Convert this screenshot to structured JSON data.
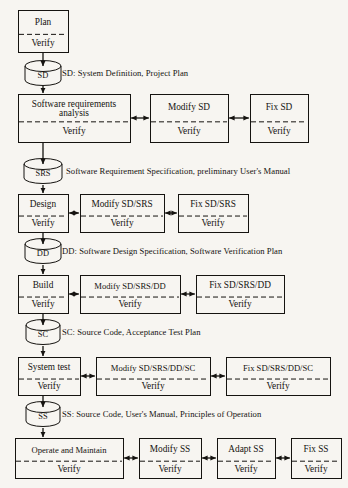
{
  "diagram": {
    "type": "flowchart",
    "background_color": "#f7f5f1",
    "ink_color": "#151310",
    "verify_label": "Verify"
  },
  "stages": [
    {
      "id": "plan",
      "main": {
        "name": "plan-box",
        "top_label": "Plan",
        "bottom_label": "Verify",
        "x": 18,
        "y": 10,
        "w": 50,
        "h": 42
      },
      "siblings": [],
      "artifact": {
        "name": "sd-cylinder",
        "label": "SD",
        "legend": "SD: System Definition, Project Plan",
        "cx": 43,
        "cy": 73,
        "rx": 18,
        "ry": 5.5,
        "body_h": 14,
        "legend_x": 62,
        "legend_y": 73
      }
    },
    {
      "id": "requirements",
      "main": {
        "name": "software-requirements-analysis-box",
        "top_label_line1": "Software requirements",
        "top_label_line2": "analysis",
        "bottom_label": "Verify",
        "x": 18,
        "y": 94,
        "w": 112,
        "h": 48
      },
      "siblings": [
        {
          "name": "modify-sd-box",
          "top_label": "Modify SD",
          "bottom_label": "Verify",
          "x": 150,
          "y": 94,
          "w": 78,
          "h": 48
        },
        {
          "name": "fix-sd-box",
          "top_label": "Fix SD",
          "bottom_label": "Verify",
          "x": 250,
          "y": 94,
          "w": 58,
          "h": 48
        }
      ],
      "artifact": {
        "name": "srs-cylinder",
        "label": "SRS",
        "legend": "Software Requirement Specification, preliminary User's Manual",
        "cx": 43,
        "cy": 171,
        "rx": 19,
        "ry": 5.5,
        "body_h": 14,
        "legend_x": 66,
        "legend_y": 171
      }
    },
    {
      "id": "design",
      "main": {
        "name": "design-box",
        "top_label": "Design",
        "bottom_label": "Verify",
        "x": 18,
        "y": 194,
        "w": 50,
        "h": 38
      },
      "siblings": [
        {
          "name": "modify-sd-srs-box",
          "top_label": "Modify SD/SRS",
          "bottom_label": "Verify",
          "x": 80,
          "y": 194,
          "w": 84,
          "h": 38
        },
        {
          "name": "fix-sd-srs-box",
          "top_label": "Fix SD/SRS",
          "bottom_label": "Verify",
          "x": 178,
          "y": 194,
          "w": 70,
          "h": 38
        }
      ],
      "artifact": {
        "name": "dd-cylinder",
        "label": "DD",
        "legend": "DD: Software Design Specification, Software Verification Plan",
        "cx": 43,
        "cy": 251,
        "rx": 18,
        "ry": 5.5,
        "body_h": 14,
        "legend_x": 62,
        "legend_y": 251
      }
    },
    {
      "id": "build",
      "main": {
        "name": "build-box",
        "top_label": "Build",
        "bottom_label": "Verify",
        "x": 18,
        "y": 275,
        "w": 50,
        "h": 38
      },
      "siblings": [
        {
          "name": "modify-sd-srs-dd-box",
          "top_label": "Modify SD/SRS/DD",
          "bottom_label": "Verify",
          "x": 80,
          "y": 275,
          "w": 100,
          "h": 38
        },
        {
          "name": "fix-sd-srs-dd-box",
          "top_label": "Fix SD/SRS/DD",
          "bottom_label": "Verify",
          "x": 196,
          "y": 275,
          "w": 88,
          "h": 38
        }
      ],
      "artifact": {
        "name": "sc-cylinder",
        "label": "SC",
        "legend": "SC: Source Code, Acceptance Test Plan",
        "cx": 43,
        "cy": 332,
        "rx": 17,
        "ry": 5.5,
        "body_h": 14,
        "legend_x": 62,
        "legend_y": 332
      }
    },
    {
      "id": "system-test",
      "main": {
        "name": "system-test-box",
        "top_label": "System test",
        "bottom_label": "Verify",
        "x": 18,
        "y": 357,
        "w": 62,
        "h": 38
      },
      "siblings": [
        {
          "name": "modify-sd-srs-dd-sc-box",
          "top_label": "Modify SD/SRS/DD/SC",
          "bottom_label": "Verify",
          "x": 96,
          "y": 357,
          "w": 114,
          "h": 38
        },
        {
          "name": "fix-sd-srs-dd-sc-box",
          "top_label": "Fix SD/SRS/DD/SC",
          "bottom_label": "Verify",
          "x": 226,
          "y": 357,
          "w": 104,
          "h": 38
        }
      ],
      "artifact": {
        "name": "ss-cylinder",
        "label": "SS",
        "legend": "SS: Source Code, User's Manual, Principles of Operation",
        "cx": 43,
        "cy": 414,
        "rx": 17,
        "ry": 5.5,
        "body_h": 14,
        "legend_x": 62,
        "legend_y": 414
      }
    },
    {
      "id": "operate",
      "main": {
        "name": "operate-and-maintain-box",
        "top_label": "Operate and Maintain",
        "bottom_label": "Verify",
        "x": 15,
        "y": 438,
        "w": 108,
        "h": 40
      },
      "siblings": [
        {
          "name": "modify-ss-box",
          "top_label": "Modify SS",
          "bottom_label": "Verify",
          "x": 139,
          "y": 438,
          "w": 62,
          "h": 40
        },
        {
          "name": "adapt-ss-box",
          "top_label": "Adapt SS",
          "bottom_label": "Verify",
          "x": 217,
          "y": 438,
          "w": 58,
          "h": 40
        },
        {
          "name": "fix-ss-box",
          "top_label": "Fix SS",
          "bottom_label": "Verify",
          "x": 291,
          "y": 438,
          "w": 50,
          "h": 40
        }
      ],
      "artifact": null
    }
  ],
  "connectors": {
    "vertical_arrows": [
      {
        "name": "arrow-plan-to-sd",
        "x": 43,
        "y1": 52,
        "y2": 67
      },
      {
        "name": "arrow-sd-to-requirements",
        "x": 43,
        "y1": 86,
        "y2": 94
      },
      {
        "name": "arrow-requirements-to-srs",
        "x": 43,
        "y1": 142,
        "y2": 165
      },
      {
        "name": "arrow-srs-to-design",
        "x": 43,
        "y1": 185,
        "y2": 194
      },
      {
        "name": "arrow-design-to-dd",
        "x": 43,
        "y1": 232,
        "y2": 245
      },
      {
        "name": "arrow-dd-to-build",
        "x": 43,
        "y1": 265,
        "y2": 275
      },
      {
        "name": "arrow-build-to-sc",
        "x": 43,
        "y1": 313,
        "y2": 326
      },
      {
        "name": "arrow-sc-to-systemtest",
        "x": 43,
        "y1": 346,
        "y2": 357
      },
      {
        "name": "arrow-systemtest-to-ss",
        "x": 43,
        "y1": 395,
        "y2": 408
      },
      {
        "name": "arrow-ss-to-operate",
        "x": 43,
        "y1": 428,
        "y2": 438
      }
    ],
    "double_arrows": [
      {
        "name": "arrow-requirements-modifysd",
        "x1": 130,
        "x2": 150,
        "y": 118
      },
      {
        "name": "arrow-modifysd-fixsd",
        "x1": 228,
        "x2": 250,
        "y": 118
      },
      {
        "name": "arrow-design-modify",
        "x1": 68,
        "x2": 80,
        "y": 213
      },
      {
        "name": "arrow-modify-fix-design",
        "x1": 164,
        "x2": 178,
        "y": 213
      },
      {
        "name": "arrow-build-modify",
        "x1": 68,
        "x2": 80,
        "y": 294
      },
      {
        "name": "arrow-modify-fix-build",
        "x1": 180,
        "x2": 196,
        "y": 294
      },
      {
        "name": "arrow-systemtest-modify",
        "x1": 80,
        "x2": 96,
        "y": 376
      },
      {
        "name": "arrow-modify-fix-systemtest",
        "x1": 210,
        "x2": 226,
        "y": 376
      },
      {
        "name": "arrow-operate-modifyss",
        "x1": 123,
        "x2": 139,
        "y": 458
      },
      {
        "name": "arrow-modifyss-adaptss",
        "x1": 201,
        "x2": 217,
        "y": 458
      },
      {
        "name": "arrow-adaptss-fixss",
        "x1": 275,
        "x2": 291,
        "y": 458
      }
    ]
  }
}
